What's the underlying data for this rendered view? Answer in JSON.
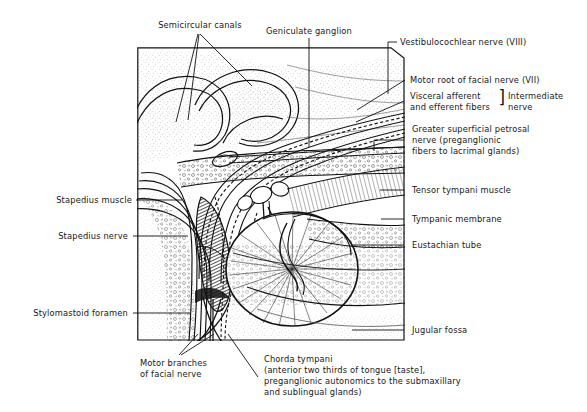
{
  "figure": {
    "frame": {
      "x": 137,
      "y": 47,
      "width": 268,
      "height": 294
    },
    "ink_color": "#111111",
    "background_color": "#ffffff"
  },
  "labels": {
    "semicircular_canals": "Semicircular canals",
    "geniculate_ganglion": "Geniculate ganglion",
    "vestibulocochlear_nerve": "Vestibulocochlear nerve (VIII)",
    "motor_root_facial_nerve": "Motor root of facial nerve (VII)",
    "visceral_fibers_line1": "Visceral afferent",
    "visceral_fibers_line2": "and efferent fibers",
    "intermediate_nerve_line1": "Intermediate",
    "intermediate_nerve_line2": "nerve",
    "greater_petrosal_line1": "Greater superficial petrosal",
    "greater_petrosal_line2": "nerve (preganglionic",
    "greater_petrosal_line3": "fibers to lacrimal glands)",
    "tensor_tympani_muscle": "Tensor tympani muscle",
    "tympanic_membrane": "Tympanic membrane",
    "eustachian_tube": "Eustachian tube",
    "jugular_fossa": "Jugular fossa",
    "stapedius_muscle": "Stapedius muscle",
    "stapedius_nerve": "Stapedius nerve",
    "stylomastoid_foramen": "Stylomastoid foramen",
    "motor_branches_line1": "Motor branches",
    "motor_branches_line2": "of facial nerve",
    "chorda_tympani_line1": "Chorda tympani",
    "chorda_tympani_line2": "(anterior two thirds of tongue [taste],",
    "chorda_tympani_line3": "preganglionic autonomics to the submaxillary",
    "chorda_tympani_line4": "and sublingual glands)",
    "bracket_glyph": "]"
  }
}
